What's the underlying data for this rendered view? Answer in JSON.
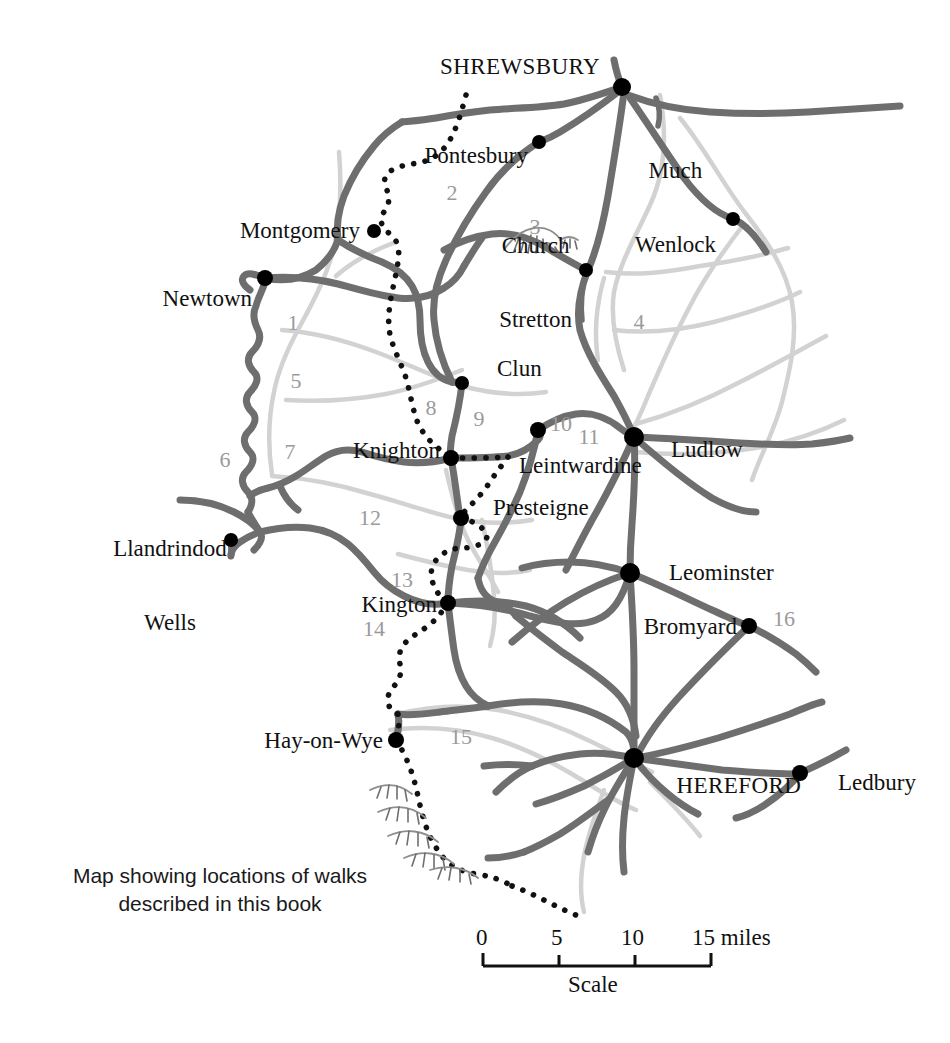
{
  "map": {
    "caption_line1": "Map showing locations of walks",
    "caption_line2": "described in this book",
    "scale": {
      "label": "Scale",
      "ticks": [
        "0",
        "5",
        "10",
        "15 miles"
      ],
      "tick_values": [
        0,
        5,
        10,
        15
      ],
      "unit": "miles"
    },
    "colors": {
      "road": "#6e6e6e",
      "river": "#d2d2d2",
      "border_dots": "#111111",
      "town_dot": "#000000",
      "region_number": "#9a9a9a",
      "label_text": "#111111",
      "background": "#ffffff"
    },
    "places": [
      {
        "name": "SHREWSBURY",
        "style": "major",
        "x": 622,
        "y": 87,
        "label_x": 600,
        "label_y": 67,
        "anchor": "r",
        "lines": [
          "SHREWSBURY"
        ]
      },
      {
        "name": "Pontesbury",
        "style": "minor",
        "x": 539,
        "y": 142,
        "label_x": 528,
        "label_y": 156,
        "anchor": "r",
        "lines": [
          "Pontesbury"
        ]
      },
      {
        "name": "Much Wenlock",
        "style": "minor",
        "x": 733,
        "y": 219,
        "label_x": 716,
        "label_y": 208,
        "anchor": "r",
        "lines": [
          "Much",
          "Wenlock"
        ]
      },
      {
        "name": "Montgomery",
        "style": "minor",
        "x": 374,
        "y": 231,
        "label_x": 360,
        "label_y": 231,
        "anchor": "r",
        "lines": [
          "Montgomery"
        ]
      },
      {
        "name": "Church Stretton",
        "style": "minor",
        "x": 586,
        "y": 270,
        "label_x": 570,
        "label_y": 283,
        "anchor": "r",
        "lines": [
          "Church",
          "Stretton"
        ]
      },
      {
        "name": "Newtown",
        "style": "minor",
        "x": 265,
        "y": 278,
        "label_x": 252,
        "label_y": 299,
        "anchor": "r",
        "lines": [
          "Newtown"
        ]
      },
      {
        "name": "Clun",
        "style": "minor",
        "x": 462,
        "y": 383,
        "label_x": 474,
        "label_y": 369,
        "anchor": "l",
        "lines": [
          "Clun"
        ]
      },
      {
        "name": "Leintwardine",
        "style": "minor",
        "x": 538,
        "y": 430,
        "label_x": 498,
        "label_y": 466,
        "anchor": "l",
        "lines": [
          "Leintwardine"
        ]
      },
      {
        "name": "Ludlow",
        "style": "minor",
        "x": 634,
        "y": 437,
        "label_x": 648,
        "label_y": 450,
        "anchor": "l",
        "lines": [
          "Ludlow"
        ]
      },
      {
        "name": "Knighton",
        "style": "minor",
        "x": 451,
        "y": 458,
        "label_x": 440,
        "label_y": 451,
        "anchor": "r",
        "lines": [
          "Knighton"
        ]
      },
      {
        "name": "Presteigne",
        "style": "minor",
        "x": 461,
        "y": 518,
        "label_x": 472,
        "label_y": 508,
        "anchor": "l",
        "lines": [
          "Presteigne"
        ]
      },
      {
        "name": "Llandrindod Wells",
        "style": "minor",
        "x": 231,
        "y": 540,
        "label_x": 170,
        "label_y": 586,
        "anchor": "c",
        "lines": [
          "Llandrindod",
          "Wells"
        ]
      },
      {
        "name": "Leominster",
        "style": "minor",
        "x": 630,
        "y": 573,
        "label_x": 646,
        "label_y": 573,
        "anchor": "l",
        "lines": [
          "Leominster"
        ]
      },
      {
        "name": "Kington",
        "style": "minor",
        "x": 448,
        "y": 603,
        "label_x": 437,
        "label_y": 605,
        "anchor": "r",
        "lines": [
          "Kington"
        ]
      },
      {
        "name": "Bromyard",
        "style": "minor",
        "x": 749,
        "y": 626,
        "label_x": 737,
        "label_y": 627,
        "anchor": "r",
        "lines": [
          "Bromyard"
        ]
      },
      {
        "name": "Hay-on-Wye",
        "style": "minor",
        "x": 396,
        "y": 740,
        "label_x": 383,
        "label_y": 741,
        "anchor": "r",
        "lines": [
          "Hay-on-Wye"
        ]
      },
      {
        "name": "HEREFORD",
        "style": "major",
        "x": 634,
        "y": 758,
        "label_x": 652,
        "label_y": 786,
        "anchor": "l",
        "lines": [
          "HEREFORD"
        ]
      },
      {
        "name": "Ledbury",
        "style": "minor",
        "x": 800,
        "y": 773,
        "label_x": 815,
        "label_y": 783,
        "anchor": "l",
        "lines": [
          "Ledbury"
        ]
      }
    ],
    "region_numbers": [
      {
        "n": "1",
        "x": 293,
        "y": 323
      },
      {
        "n": "2",
        "x": 452,
        "y": 193
      },
      {
        "n": "3",
        "x": 535,
        "y": 227
      },
      {
        "n": "4",
        "x": 639,
        "y": 322
      },
      {
        "n": "5",
        "x": 296,
        "y": 381
      },
      {
        "n": "6",
        "x": 225,
        "y": 460
      },
      {
        "n": "7",
        "x": 290,
        "y": 452
      },
      {
        "n": "8",
        "x": 431,
        "y": 408
      },
      {
        "n": "9",
        "x": 479,
        "y": 419
      },
      {
        "n": "10",
        "x": 561,
        "y": 424
      },
      {
        "n": "11",
        "x": 589,
        "y": 437
      },
      {
        "n": "12",
        "x": 370,
        "y": 518
      },
      {
        "n": "13",
        "x": 402,
        "y": 580
      },
      {
        "n": "14",
        "x": 374,
        "y": 629
      },
      {
        "n": "15",
        "x": 461,
        "y": 737
      },
      {
        "n": "16",
        "x": 784,
        "y": 619
      }
    ],
    "hills": [
      {
        "name": "long-mynd-hills",
        "x": 530,
        "y": 244
      },
      {
        "name": "black-mountains-hills",
        "x": 410,
        "y": 820
      }
    ]
  }
}
